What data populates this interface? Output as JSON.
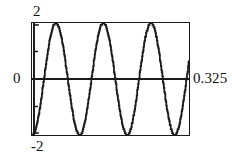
{
  "figure": {
    "name": "sine-wave-plot",
    "background_color": "#ffffff",
    "line_color": "#1a1a1a",
    "frame_color": "#1a1a1a"
  },
  "labels": {
    "y_max": "2",
    "y_zero": "0",
    "y_min": "-2",
    "x_max": "0.325"
  },
  "chart_data": {
    "type": "line",
    "title": "",
    "xlabel": "",
    "ylabel": "",
    "xlim": [
      0,
      0.325
    ],
    "ylim": [
      -2,
      2
    ],
    "xticks": [
      0,
      0.325
    ],
    "xticklabels": [
      "",
      "0.325"
    ],
    "yticks": [
      -2,
      0,
      2
    ],
    "yticklabels": [
      "-2",
      "0",
      "2"
    ],
    "grid": false,
    "legend": null,
    "zero_line": 0,
    "series": [
      {
        "name": "v(t)",
        "description": "sine wave, amplitude 2, starting at minimum, about 3.3 cycles across the window",
        "amplitude": 2,
        "cycles": 3.3,
        "period": 0.0984,
        "frequency_hz": 10.15,
        "phase": "starts at -2 (negative peak) at x = 0",
        "x": [
          0,
          0.0123,
          0.0246,
          0.0369,
          0.0492,
          0.0615,
          0.0738,
          0.0861,
          0.0984,
          0.1107,
          0.123,
          0.1353,
          0.1476,
          0.1599,
          0.1722,
          0.1845,
          0.1968,
          0.2091,
          0.2214,
          0.2337,
          0.246,
          0.2583,
          0.2706,
          0.2829,
          0.2952,
          0.3075,
          0.3198,
          0.325
        ],
        "y": [
          -2,
          -1.41,
          0,
          1.41,
          2,
          1.41,
          0,
          -1.41,
          -2,
          -1.41,
          0,
          1.41,
          2,
          1.41,
          0,
          -1.41,
          -2,
          -1.41,
          0,
          1.41,
          2,
          1.41,
          0,
          -1.41,
          -2,
          -1.41,
          0,
          0.33
        ]
      }
    ]
  }
}
